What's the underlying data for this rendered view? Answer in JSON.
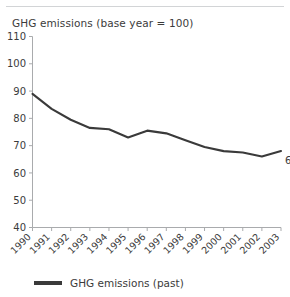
{
  "figure": {
    "title": "GHG emissions (base year = 100)"
  },
  "legend": {
    "position": "bottom-left",
    "entries": [
      {
        "label": "GHG emissions (past)",
        "color": "#3a3a3a"
      }
    ]
  },
  "annotations": [
    {
      "text": "68",
      "x": "2003",
      "y": 68
    }
  ],
  "chart_data": {
    "type": "line",
    "title": "GHG emissions (base year = 100)",
    "xlabel": "",
    "ylabel": "",
    "ylim": [
      40,
      110
    ],
    "yticks": [
      40,
      50,
      60,
      70,
      80,
      90,
      100,
      110
    ],
    "grid": false,
    "legend_position": "bottom-left",
    "categories": [
      "1990",
      "1991",
      "1992",
      "1993",
      "1994",
      "1995",
      "1996",
      "1997",
      "1998",
      "1999",
      "2000",
      "2001",
      "2002",
      "2003"
    ],
    "series": [
      {
        "name": "GHG emissions (past)",
        "color": "#3a3a3a",
        "values": [
          89,
          83.5,
          79.5,
          76.5,
          76,
          73,
          75.5,
          74.5,
          72,
          69.5,
          68,
          67.5,
          66,
          68
        ]
      }
    ],
    "data_labels": [
      {
        "category": "2003",
        "value": 68,
        "text": "68"
      }
    ]
  }
}
